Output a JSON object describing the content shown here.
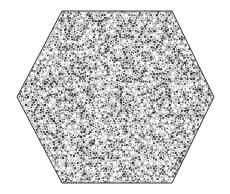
{
  "figure": {
    "background_color": "#ffffff",
    "canvas": {
      "width": 230,
      "height": 194
    },
    "caption": ""
  },
  "shape": {
    "name": "hexagon",
    "orientation": "flat-top",
    "vertices": [
      {
        "x": 17,
        "y": 97
      },
      {
        "x": 62,
        "y": 11
      },
      {
        "x": 172,
        "y": 11
      },
      {
        "x": 214,
        "y": 97
      },
      {
        "x": 172,
        "y": 183
      },
      {
        "x": 62,
        "y": 183
      }
    ],
    "stroke_color": "#3a3a3a",
    "stroke_width": 1,
    "fill_color": "#ffffff",
    "width_px": 197,
    "height_px": 172
  },
  "pattern": {
    "name": "quasiperiodic-rosette-dots",
    "description": "Dense quasiperiodic lattice of small dark square dots arranged in rosette clusters",
    "dot_color": "#2b2b2b",
    "mid_dot_color": "#8a8a8a",
    "light_dot_color": "#c4c4c4",
    "dot_size_px": 1.6,
    "cell_pitch_px": 6.1,
    "rosette_ring_count": 6,
    "rosette_radius_px": 2.5,
    "overall_tone": "#d9d9d9",
    "seed": 20250114,
    "symmetry_order": 12
  },
  "chart_data": {
    "type": "scatter",
    "subtitle": "",
    "xlabel": "",
    "ylabel": "",
    "xlim": [
      0,
      230
    ],
    "ylim": [
      0,
      194
    ],
    "grid": false,
    "legend": "none",
    "annotations": [],
    "tick_labels": {
      "x": [],
      "y": []
    },
    "series": [
      {
        "name": "hexagon-boundary",
        "type": "line",
        "closed": true,
        "color": "#3a3a3a",
        "x": [
          17,
          62,
          172,
          214,
          172,
          62
        ],
        "y": [
          97,
          11,
          11,
          97,
          183,
          183
        ]
      },
      {
        "name": "rosette-dot-lattice",
        "type": "scatter",
        "color": "#2b2b2b",
        "marker": "square",
        "marker_size": 1.6,
        "point_count": 2200,
        "lattice_pitch": 6.1,
        "clipped_to": "hexagon-boundary"
      }
    ]
  }
}
